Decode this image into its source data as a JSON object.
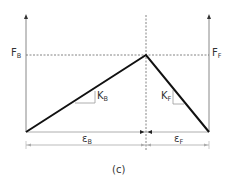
{
  "diagram": {
    "type": "force-displacement bilinear diagram",
    "caption": "(c)",
    "labels": {
      "force_left": {
        "main": "F",
        "sub": "B"
      },
      "force_right": {
        "main": "F",
        "sub": "F"
      },
      "stiffness_left": {
        "main": "K",
        "sub": "B"
      },
      "stiffness_right": {
        "main": "K",
        "sub": "F"
      },
      "strain_left": {
        "main": "ε",
        "sub": "B"
      },
      "strain_right": {
        "main": "ε",
        "sub": "F"
      }
    },
    "colors": {
      "curve": "#111111",
      "axes": "#888888",
      "dashed": "#555555",
      "text": "#333333"
    }
  }
}
